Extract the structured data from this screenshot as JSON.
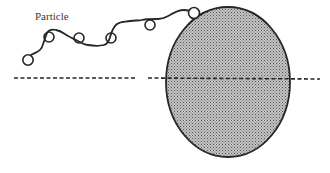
{
  "diagram": {
    "labels": {
      "particle": "Particle"
    },
    "colors": {
      "stroke": "#262626",
      "fill": "#9a9a9a",
      "dash": "#262626",
      "background": "#ffffff"
    },
    "elements": {
      "collector": {
        "shape": "ellipse",
        "cx": 228,
        "cy": 82,
        "rx": 62,
        "ry": 75,
        "texture": "stippled gray"
      },
      "axis_line": {
        "style": "dashed",
        "y": 78,
        "segments": [
          [
            14,
            136
          ],
          [
            148,
            320
          ]
        ]
      },
      "trajectory_loops": [
        {
          "cx": 28,
          "cy": 60,
          "r": 5
        },
        {
          "cx": 49,
          "cy": 37,
          "r": 5
        },
        {
          "cx": 79,
          "cy": 38,
          "r": 5
        },
        {
          "cx": 111,
          "cy": 38,
          "r": 5
        },
        {
          "cx": 150,
          "cy": 25,
          "r": 5
        },
        {
          "cx": 193,
          "cy": 13,
          "r": 5
        }
      ]
    }
  }
}
